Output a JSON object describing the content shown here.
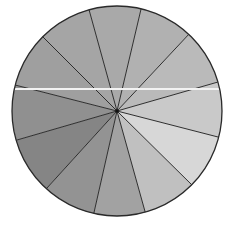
{
  "diagram": {
    "type": "segmented-circle",
    "center": [
      117,
      111
    ],
    "radius": 105,
    "outline_color": "#2a2a2a",
    "spoke_color": "#2e2e2e",
    "background": "#ffffff",
    "wedge_count": 12,
    "spoke_endpoints": [
      [
        88,
        6
      ],
      [
        142,
        5
      ],
      [
        190,
        33
      ],
      [
        218,
        82
      ],
      [
        218,
        137
      ],
      [
        192,
        185
      ],
      [
        146,
        215
      ],
      [
        93,
        217
      ],
      [
        47,
        188
      ],
      [
        17,
        140
      ],
      [
        15,
        85
      ],
      [
        42,
        36
      ]
    ],
    "wedges": [
      {
        "index": 1,
        "fill": "#a9a9a9"
      },
      {
        "index": 2,
        "fill": "#b1b1b1"
      },
      {
        "index": 3,
        "fill": "#bababa"
      },
      {
        "index": 4,
        "fill": "#c9c9c9"
      },
      {
        "index": 5,
        "fill": "#d7d7d7"
      },
      {
        "index": 6,
        "fill": "#c0c0c0"
      },
      {
        "index": 7,
        "fill": "#a2a2a2"
      },
      {
        "index": 8,
        "fill": "#939393"
      },
      {
        "index": 9,
        "fill": "#858585"
      },
      {
        "index": 10,
        "fill": "#909090"
      },
      {
        "index": 11,
        "fill": "#9f9f9f"
      },
      {
        "index": 12,
        "fill": "#a5a5a5"
      }
    ],
    "highlight_line": {
      "y": 89,
      "x1": 13,
      "x2": 221,
      "color": "#f2f2f2",
      "width": 2
    }
  }
}
